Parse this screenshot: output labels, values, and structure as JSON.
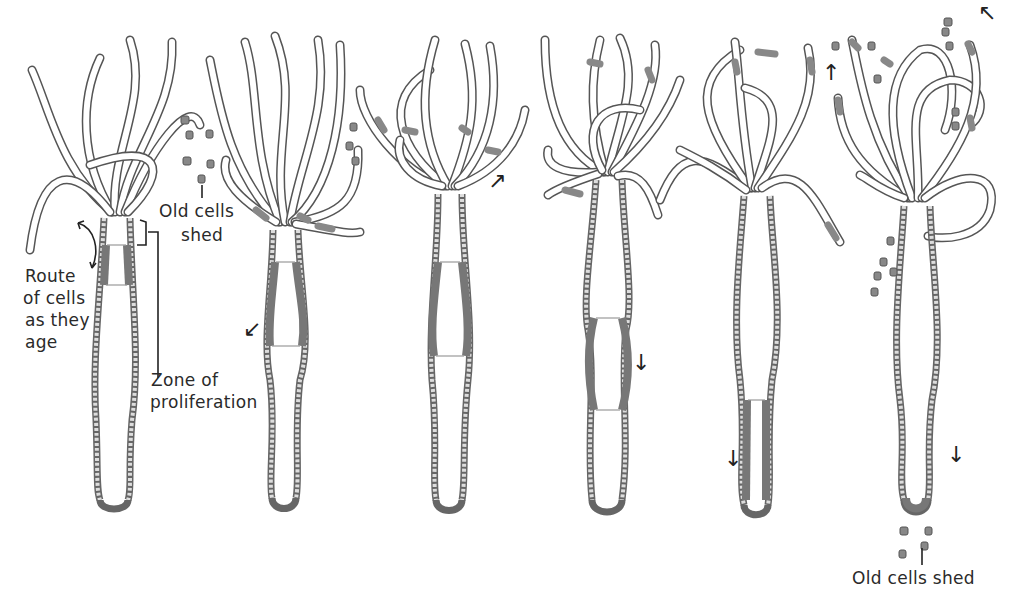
{
  "figure": {
    "stages": 6,
    "labels": {
      "old_cells_shed_top": "Old cells\nshed",
      "old_cells_shed_top_line1": "Old cells",
      "old_cells_shed_top_line2": "shed",
      "route_line1": "Route",
      "route_line2": "of cells",
      "route_line3": "as they",
      "route_line4": "age",
      "zone_line1": "Zone of",
      "zone_line2": "proliferation",
      "old_cells_shed_bottom": "Old cells shed"
    },
    "arrows": [
      {
        "stage": 2,
        "glyph": "↙",
        "direction": "down"
      },
      {
        "stage": 3,
        "glyph": "↗",
        "direction": "up-right"
      },
      {
        "stage": 4,
        "glyph": "↓",
        "direction": "down"
      },
      {
        "stage": 5,
        "glyph": "↑",
        "direction": "up"
      },
      {
        "stage": 5,
        "glyph": "↓",
        "direction": "down"
      },
      {
        "stage": 6,
        "glyph": "↖",
        "direction": "up-left"
      },
      {
        "stage": 6,
        "glyph": "↓",
        "direction": "down"
      }
    ],
    "colors": {
      "line": "#555555",
      "marked_tissue": "#888888",
      "text": "#2a2a2a",
      "background": "#ffffff"
    }
  }
}
